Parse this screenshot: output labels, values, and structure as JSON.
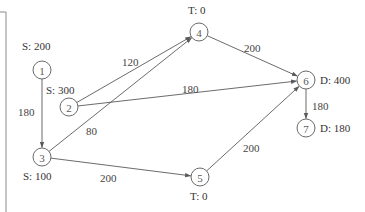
{
  "diagram": {
    "type": "network-flow",
    "nodes": [
      {
        "id": "1",
        "label": "1",
        "annotation": "S: 200",
        "x": 42,
        "y": 70,
        "tag_x": 22,
        "tag_y": 50
      },
      {
        "id": "2",
        "label": "2",
        "annotation": "S: 300",
        "x": 69,
        "y": 107,
        "tag_x": 46,
        "tag_y": 94
      },
      {
        "id": "3",
        "label": "3",
        "annotation": "S: 100",
        "x": 42,
        "y": 157,
        "tag_x": 23,
        "tag_y": 180
      },
      {
        "id": "4",
        "label": "4",
        "annotation": "T: 0",
        "x": 199,
        "y": 32,
        "tag_x": 188,
        "tag_y": 14
      },
      {
        "id": "5",
        "label": "5",
        "annotation": "T: 0",
        "x": 200,
        "y": 177,
        "tag_x": 190,
        "tag_y": 200
      },
      {
        "id": "6",
        "label": "6",
        "annotation": "D: 400",
        "x": 306,
        "y": 80,
        "tag_x": 320,
        "tag_y": 84
      },
      {
        "id": "7",
        "label": "7",
        "annotation": "D: 180",
        "x": 306,
        "y": 128,
        "tag_x": 320,
        "tag_y": 132
      }
    ],
    "edges": [
      {
        "from": "1",
        "to": "3",
        "weight": "180",
        "label_x": 18,
        "label_y": 116
      },
      {
        "from": "2",
        "to": "4",
        "weight": "120",
        "label_x": 122,
        "label_y": 66
      },
      {
        "from": "2",
        "to": "6",
        "weight": "180",
        "label_x": 182,
        "label_y": 93
      },
      {
        "from": "3",
        "to": "4",
        "weight": "80",
        "label_x": 86,
        "label_y": 135
      },
      {
        "from": "3",
        "to": "5",
        "weight": "200",
        "label_x": 100,
        "label_y": 182
      },
      {
        "from": "4",
        "to": "6",
        "weight": "200",
        "label_x": 244,
        "label_y": 52
      },
      {
        "from": "5",
        "to": "6",
        "weight": "200",
        "label_x": 243,
        "label_y": 152
      },
      {
        "from": "6",
        "to": "7",
        "weight": "180",
        "label_x": 312,
        "label_y": 110
      }
    ]
  },
  "colors": {
    "node_stroke": "#6a6a6a",
    "edge": "#5a5a5a",
    "text": "#333333",
    "background": "#ffffff"
  }
}
